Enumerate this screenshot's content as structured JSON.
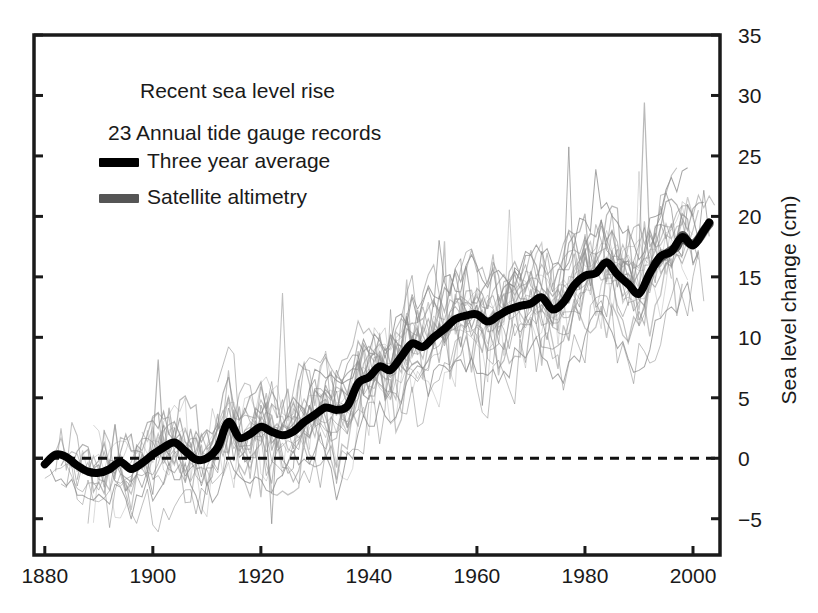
{
  "chart_data": {
    "type": "line",
    "title": "Recent sea level rise",
    "subtitle": "23 Annual tide gauge records",
    "xlabel": "",
    "ylabel": "Sea level change (cm)",
    "xlim": [
      1878,
      2005
    ],
    "ylim": [
      -8,
      35
    ],
    "grid": false,
    "y_axis_side": "right",
    "zero_reference_line": 0,
    "xticks": [
      1880,
      1900,
      1920,
      1940,
      1960,
      1980,
      2000
    ],
    "xtick_labels": [
      "1880",
      "1900",
      "1920",
      "1940",
      "1960",
      "1980",
      "2000"
    ],
    "yticks": [
      -5,
      0,
      5,
      10,
      15,
      20,
      25,
      30,
      35
    ],
    "ytick_labels": [
      "−5",
      "0",
      "5",
      "10",
      "15",
      "20",
      "25",
      "30",
      "35"
    ],
    "legend_position": "upper-left-inside",
    "legend": [
      {
        "label": "Three year average",
        "color": "#000000",
        "marker": "thick-line"
      },
      {
        "label": "Satellite altimetry",
        "color": "#555555",
        "marker": "thick-line"
      }
    ],
    "series": [
      {
        "name": "Three year average",
        "color": "#000000",
        "x": [
          1880,
          1882,
          1884,
          1886,
          1888,
          1890,
          1892,
          1894,
          1896,
          1898,
          1900,
          1902,
          1904,
          1906,
          1908,
          1910,
          1912,
          1914,
          1916,
          1918,
          1920,
          1922,
          1924,
          1926,
          1928,
          1930,
          1932,
          1934,
          1936,
          1938,
          1940,
          1942,
          1944,
          1946,
          1948,
          1950,
          1952,
          1954,
          1956,
          1958,
          1960,
          1962,
          1964,
          1966,
          1968,
          1970,
          1972,
          1974,
          1976,
          1978,
          1980,
          1982,
          1984,
          1986,
          1988,
          1990,
          1992,
          1994,
          1996,
          1998,
          2000,
          2002,
          2003
        ],
        "values": [
          -0.5,
          0.3,
          0.1,
          -0.6,
          -1.1,
          -1.2,
          -0.9,
          -0.3,
          -0.9,
          -0.4,
          0.3,
          0.9,
          1.3,
          0.6,
          -0.1,
          0.0,
          0.9,
          3.0,
          1.7,
          2.0,
          2.6,
          2.2,
          1.9,
          2.2,
          3.0,
          3.6,
          4.2,
          4.0,
          4.3,
          6.2,
          6.7,
          7.6,
          7.3,
          8.4,
          9.5,
          9.2,
          10.0,
          10.7,
          11.5,
          11.8,
          11.9,
          11.3,
          11.8,
          12.3,
          12.6,
          12.8,
          13.3,
          12.3,
          12.9,
          14.3,
          15.1,
          15.3,
          16.2,
          15.2,
          14.4,
          13.6,
          15.3,
          16.7,
          17.1,
          18.3,
          17.6,
          18.8,
          19.5
        ]
      },
      {
        "name": "Satellite altimetry",
        "color": "#555555",
        "x": [
          1993,
          1994,
          1995,
          1996,
          1997,
          1998,
          1999,
          2000,
          2001,
          2002,
          2003
        ],
        "values": [
          16.1,
          16.6,
          16.9,
          17.2,
          17.5,
          18.4,
          17.9,
          17.7,
          18.1,
          18.8,
          19.4
        ]
      }
    ],
    "background_series_note": "23 thin gray annual tide gauge record traces",
    "background_series_count": 23
  },
  "axes": {
    "y_axis_label": "Sea level change (cm)"
  },
  "annotations": {
    "title": "Recent sea level rise",
    "subtitle": "23 Annual tide gauge records",
    "legend_three_year": "Three year average",
    "legend_satellite": "Satellite altimetry"
  },
  "colors": {
    "average_line": "#000000",
    "satellite_line": "#555555",
    "tide_gauge": "#8c8c8c",
    "axis": "#1a1a1a",
    "background": "#ffffff"
  }
}
